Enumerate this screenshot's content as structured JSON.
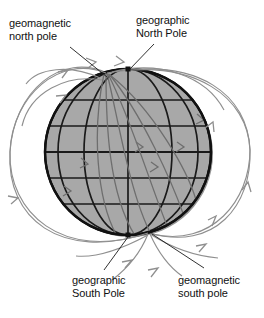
{
  "figure": {
    "background_color": "#ffffff",
    "sphere": {
      "center_x": 128,
      "center_y": 152,
      "radius": 83,
      "fill_color": "#a8a8a8",
      "outline_color": "#111111",
      "grid_color": "#1a1a1a",
      "latitude_line_count": 5,
      "longitude_line_count": 7
    },
    "field_lines": {
      "color": "#8c8c8c",
      "arrow_count_external": 10,
      "arrow_count_internal": 5,
      "description": "dipole magnetic field lines exiting near the geomagnetic south pole and entering near the geomagnetic north pole"
    },
    "magnetic_axis": {
      "tilt_degrees": 17,
      "north_end_x": 107,
      "north_end_y": 72,
      "south_end_x": 149,
      "south_end_y": 232
    },
    "rotation_axis": {
      "north_end_x": 128,
      "north_end_y": 69,
      "south_end_x": 128,
      "south_end_y": 235
    }
  },
  "labels": {
    "geomagnetic_north": {
      "line1": "geomagnetic",
      "line2": "north pole",
      "leader_from_x": 72,
      "leader_from_y": 47,
      "leader_to_x": 108,
      "leader_to_y": 76
    },
    "geographic_north": {
      "line1": "geographic",
      "line2": "North Pole",
      "leader_from_x": 152,
      "leader_from_y": 45,
      "leader_to_x": 129,
      "leader_to_y": 70
    },
    "geographic_south": {
      "line1": "geographic",
      "line2": "South Pole",
      "leader_from_x": 104,
      "leader_from_y": 268,
      "leader_to_x": 128,
      "leader_to_y": 236
    },
    "geomagnetic_south": {
      "line1": "geomagnetic",
      "line2": "south pole",
      "leader_from_x": 202,
      "leader_from_y": 268,
      "leader_to_x": 151,
      "leader_to_y": 234
    }
  }
}
